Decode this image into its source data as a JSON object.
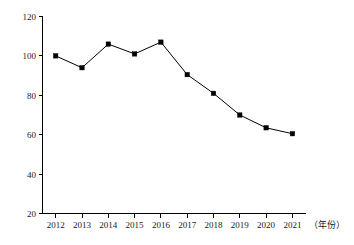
{
  "chart_data": {
    "type": "line",
    "title": "",
    "subtitle": "",
    "xlabel": "（年份）",
    "ylabel": "",
    "categories": [
      "2012",
      "2013",
      "2014",
      "2015",
      "2016",
      "2017",
      "2018",
      "2019",
      "2020",
      "2021"
    ],
    "values": [
      100,
      94,
      106,
      101,
      107,
      90.5,
      81,
      70,
      63.5,
      60.5
    ],
    "series": [
      {
        "name": "",
        "values": [
          100,
          94,
          106,
          101,
          107,
          90.5,
          81,
          70,
          63.5,
          60.5
        ]
      }
    ],
    "ylim": [
      20,
      120
    ],
    "yticks": [
      20,
      40,
      60,
      80,
      100,
      120
    ],
    "ytick_labels": [
      "20",
      "40",
      "60",
      "80",
      "100",
      "120"
    ],
    "xtick_labels": [
      "2012",
      "2013",
      "2014",
      "2015",
      "2016",
      "2017",
      "2018",
      "2019",
      "2020",
      "2021"
    ],
    "grid": false,
    "legend": false,
    "legend_position": "none",
    "marker": "square",
    "line_color": "#000000",
    "marker_color": "#000000",
    "background_color": "#ffffff",
    "annotations": []
  },
  "axes": {
    "x_caption": "（年份）",
    "y_caption": ""
  }
}
